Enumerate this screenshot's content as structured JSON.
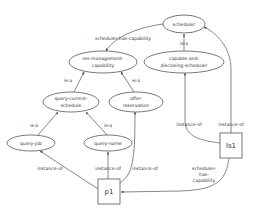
{
  "diagram": {
    "type": "semantic-network",
    "nodes": {
      "scheduler": {
        "label_lines": [
          "scheduler"
        ],
        "shape": "ellipse"
      },
      "capable": {
        "label_lines": [
          "capable-and-",
          "disclosing-scheduler"
        ],
        "shape": "ellipse"
      },
      "resmgmt": {
        "label_lines": [
          "res-management-",
          "capability"
        ],
        "shape": "ellipse"
      },
      "qcs": {
        "label_lines": [
          "query-current-",
          "schedule"
        ],
        "shape": "ellipse"
      },
      "offer": {
        "label_lines": [
          "offer-",
          "reservation"
        ],
        "shape": "ellipse"
      },
      "qjob": {
        "label_lines": [
          "query-job"
        ],
        "shape": "ellipse"
      },
      "qname": {
        "label_lines": [
          "query-name"
        ],
        "shape": "ellipse"
      },
      "p1": {
        "label_lines": [
          "p1"
        ],
        "shape": "box"
      },
      "ls1": {
        "label_lines": [
          "ls1"
        ],
        "shape": "box"
      }
    },
    "edges": [
      {
        "from": "scheduler",
        "to": "resmgmt",
        "label_lines": [
          "scheduler-has-capability"
        ]
      },
      {
        "from": "capable",
        "to": "scheduler",
        "label_lines": [
          "is-a"
        ]
      },
      {
        "from": "qcs",
        "to": "resmgmt",
        "label_lines": [
          "is-a"
        ]
      },
      {
        "from": "offer",
        "to": "resmgmt",
        "label_lines": [
          "is-a"
        ]
      },
      {
        "from": "qjob",
        "to": "qcs",
        "label_lines": [
          "is-a"
        ]
      },
      {
        "from": "qname",
        "to": "qcs",
        "label_lines": [
          "is-a"
        ]
      },
      {
        "from": "p1",
        "to": "qjob",
        "label_lines": [
          "instance-of"
        ]
      },
      {
        "from": "p1",
        "to": "qname",
        "label_lines": [
          "instance-of"
        ]
      },
      {
        "from": "p1",
        "to": "offer",
        "label_lines": [
          "instance-of"
        ]
      },
      {
        "from": "ls1",
        "to": "capable",
        "label_lines": [
          "instance-of"
        ]
      },
      {
        "from": "ls1",
        "to": "scheduler",
        "label_lines": [
          "instance-of"
        ]
      },
      {
        "from": "ls1",
        "to": "p1",
        "label_lines": [
          "scheduler-",
          "has-",
          "capability"
        ]
      }
    ]
  },
  "labels": {
    "scheduler": "scheduler",
    "capable_1": "capable-and-",
    "capable_2": "disclosing-scheduler",
    "resmgmt_1": "res-management-",
    "resmgmt_2": "capability",
    "qcs_1": "query-current-",
    "qcs_2": "schedule",
    "offer_1": "offer-",
    "offer_2": "reservation",
    "qjob": "query-job",
    "qname": "query-name",
    "p1": "p1",
    "ls1": "ls1",
    "edge_sched_has_cap": "scheduler-has-capability",
    "edge_isa_capable": "is-a",
    "edge_isa_qcs": "is-a",
    "edge_isa_offer": "is-a",
    "edge_isa_qjob": "is-a",
    "edge_isa_qname": "is-a",
    "edge_inst_qjob": "instance-of",
    "edge_inst_qname": "instance-of",
    "edge_inst_offer": "instance-of",
    "edge_inst_capable": "instance-of",
    "edge_inst_scheduler": "instance-of",
    "edge_ls1_p1_1": "scheduler-",
    "edge_ls1_p1_2": "has-",
    "edge_ls1_p1_3": "capability"
  },
  "colors": {
    "stroke": "#555555",
    "text": "#333333",
    "background": "#ffffff"
  }
}
